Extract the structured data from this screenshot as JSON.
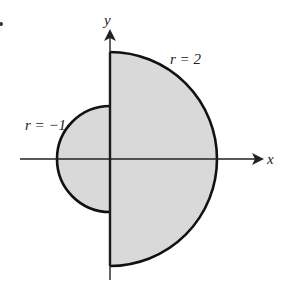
{
  "figure": {
    "type": "polar-region",
    "colors": {
      "fill": "#d9d9d9",
      "stroke": "#111111",
      "background": "#ffffff"
    },
    "axes": {
      "x_label": "x",
      "y_label": "y"
    },
    "curves": [
      {
        "label": "r = 2",
        "radius": 2,
        "side": "right half"
      },
      {
        "label": "r = −1",
        "radius": -1,
        "side": "left half"
      }
    ]
  }
}
